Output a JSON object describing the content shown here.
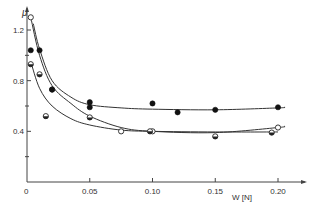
{
  "chart_data": {
    "type": "scatter",
    "title": "",
    "xlabel": "W [N]",
    "ylabel": "μ",
    "xlim": [
      0,
      0.22
    ],
    "ylim": [
      0,
      1.3
    ],
    "x_ticks": [
      "0",
      "0.05",
      "0.10",
      "0.15",
      "0.20"
    ],
    "y_ticks": [
      "0.4",
      "0.8",
      "1.2"
    ],
    "y_minor_ticks": [
      0.2,
      0.6,
      1.0
    ],
    "grid": false,
    "legend": null,
    "series": [
      {
        "name": "open circles",
        "marker": "open",
        "points": [
          [
            0.003,
            1.3
          ],
          [
            0.02,
            0.73
          ],
          [
            0.075,
            0.4
          ],
          [
            0.1,
            0.4
          ],
          [
            0.2,
            0.43
          ]
        ],
        "fit_curve": [
          [
            0.003,
            1.3
          ],
          [
            0.01,
            1.0
          ],
          [
            0.02,
            0.76
          ],
          [
            0.035,
            0.62
          ],
          [
            0.05,
            0.52
          ],
          [
            0.075,
            0.43
          ],
          [
            0.1,
            0.4
          ],
          [
            0.15,
            0.39
          ],
          [
            0.2,
            0.43
          ],
          [
            0.205,
            0.44
          ]
        ]
      },
      {
        "name": "filled circles",
        "marker": "filled",
        "points": [
          [
            0.003,
            1.04
          ],
          [
            0.01,
            1.04
          ],
          [
            0.02,
            0.73
          ],
          [
            0.05,
            0.63
          ],
          [
            0.05,
            0.59
          ],
          [
            0.1,
            0.62
          ],
          [
            0.12,
            0.55
          ],
          [
            0.15,
            0.57
          ],
          [
            0.2,
            0.59
          ]
        ],
        "fit_curve": [
          [
            0.005,
            1.25
          ],
          [
            0.01,
            1.05
          ],
          [
            0.02,
            0.8
          ],
          [
            0.035,
            0.67
          ],
          [
            0.05,
            0.61
          ],
          [
            0.075,
            0.585
          ],
          [
            0.1,
            0.575
          ],
          [
            0.15,
            0.57
          ],
          [
            0.2,
            0.585
          ],
          [
            0.205,
            0.59
          ]
        ]
      },
      {
        "name": "half-filled circles",
        "marker": "half",
        "points": [
          [
            0.003,
            0.93
          ],
          [
            0.01,
            0.85
          ],
          [
            0.015,
            0.52
          ],
          [
            0.05,
            0.51
          ],
          [
            0.098,
            0.4
          ],
          [
            0.15,
            0.36
          ],
          [
            0.195,
            0.39
          ]
        ],
        "fit_curve": [
          [
            0.003,
            0.95
          ],
          [
            0.01,
            0.74
          ],
          [
            0.02,
            0.6
          ],
          [
            0.035,
            0.5
          ],
          [
            0.05,
            0.45
          ],
          [
            0.075,
            0.41
          ],
          [
            0.1,
            0.4
          ],
          [
            0.15,
            0.395
          ],
          [
            0.2,
            0.395
          ]
        ]
      }
    ]
  }
}
